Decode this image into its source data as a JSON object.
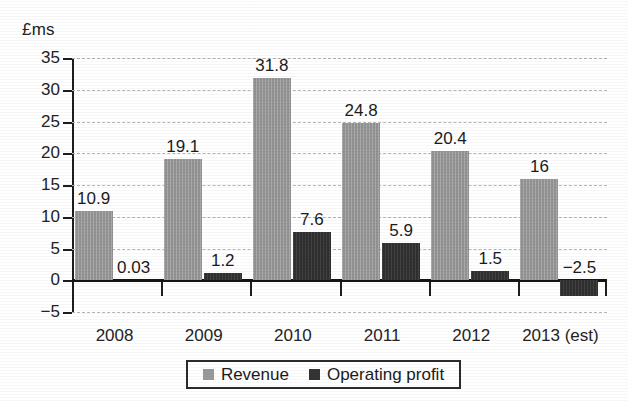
{
  "chart_data": {
    "type": "bar",
    "title": "",
    "subtitle": "",
    "xlabel": "",
    "ylabel": "£ms",
    "ylim": [
      -5,
      35
    ],
    "ytick_step": 5,
    "yticks": [
      "35",
      "30",
      "25",
      "20",
      "15",
      "10",
      "5",
      "0",
      "−5"
    ],
    "ytick_values": [
      35,
      30,
      25,
      20,
      15,
      10,
      5,
      0,
      -5
    ],
    "grid": true,
    "grid_style": "dashed-horizontal",
    "zero_line": true,
    "legend_position": "bottom-center",
    "categories": [
      "2008",
      "2009",
      "2010",
      "2011",
      "2012",
      "2013 (est)"
    ],
    "series": [
      {
        "name": "Revenue",
        "color": "#9a9a9a",
        "values": [
          10.9,
          19.1,
          31.8,
          24.8,
          20.4,
          16
        ],
        "labels": [
          "10.9",
          "19.1",
          "31.8",
          "24.8",
          "20.4",
          "16"
        ]
      },
      {
        "name": "Operating profit",
        "color": "#343434",
        "values": [
          0.03,
          1.2,
          7.6,
          5.9,
          1.5,
          -2.5
        ],
        "labels": [
          "0.03",
          "1.2",
          "7.6",
          "5.9",
          "1.5",
          "−2.5"
        ]
      }
    ]
  },
  "legend": {
    "items": [
      {
        "label": "Revenue",
        "swatch": "revenue-swatch"
      },
      {
        "label": "Operating profit",
        "swatch": "operating-profit-swatch"
      }
    ]
  },
  "colors": {
    "revenue": "#9a9a9a",
    "operating_profit": "#343434",
    "axis": "#1d1d1d",
    "grid": "#b4b4b4",
    "background": "#ffffff"
  }
}
